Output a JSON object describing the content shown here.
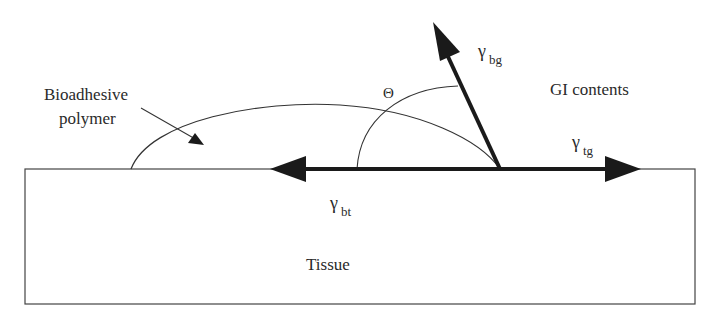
{
  "diagram": {
    "labels": {
      "polymer": [
        "Bioadhesive",
        "polymer"
      ],
      "gi_contents": "GI contents",
      "tissue": "Tissue",
      "theta": "Θ",
      "gamma_bg": {
        "symbol": "γ",
        "sub": "bg"
      },
      "gamma_tg": {
        "symbol": "γ",
        "sub": "tg"
      },
      "gamma_bt": {
        "symbol": "γ",
        "sub": "bt"
      }
    },
    "colors": {
      "line": "#2a2a2a",
      "arrow": "#1a1a1a"
    }
  }
}
